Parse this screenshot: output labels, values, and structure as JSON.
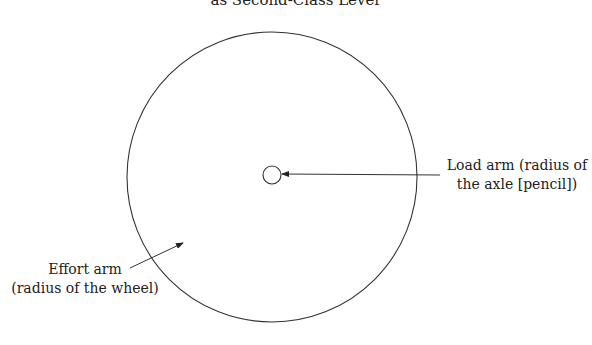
{
  "title": "as Second-Class Lever",
  "labels": {
    "load_line1": "Load arm (radius of",
    "load_line2": "the axle [pencil])",
    "effort_line1": "Effort arm",
    "effort_line2": "(radius of the wheel)"
  },
  "shapes": {
    "wheel": {
      "cx": 272,
      "cy": 177,
      "r": 145
    },
    "axle": {
      "cx": 272,
      "cy": 175,
      "r": 9
    }
  },
  "colors": {
    "stroke": "#333333"
  }
}
